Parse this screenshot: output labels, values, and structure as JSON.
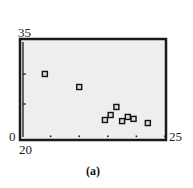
{
  "chart_data": {
    "type": "scatter",
    "title": "",
    "caption": "(a)",
    "xlabel": "",
    "ylabel": "",
    "xlim": [
      20,
      25
    ],
    "ylim": [
      0,
      35
    ],
    "grid": false,
    "legend": null,
    "tick_labels": {
      "xmin": "20",
      "xmax": "25",
      "ymin": "0",
      "ymax": "35"
    },
    "points": [
      {
        "x": 20.8,
        "y": 23.1
      },
      {
        "x": 22.0,
        "y": 18.4
      },
      {
        "x": 22.9,
        "y": 6.5
      },
      {
        "x": 23.1,
        "y": 8.3
      },
      {
        "x": 23.3,
        "y": 11.2
      },
      {
        "x": 23.5,
        "y": 6.1
      },
      {
        "x": 23.7,
        "y": 7.6
      },
      {
        "x": 23.9,
        "y": 6.9
      },
      {
        "x": 24.4,
        "y": 5.4
      }
    ],
    "marker": "hollow-square",
    "colors": {
      "frame": "#1a1a1a",
      "plot_bg": "#eeeeee",
      "marker": "#111111"
    }
  }
}
